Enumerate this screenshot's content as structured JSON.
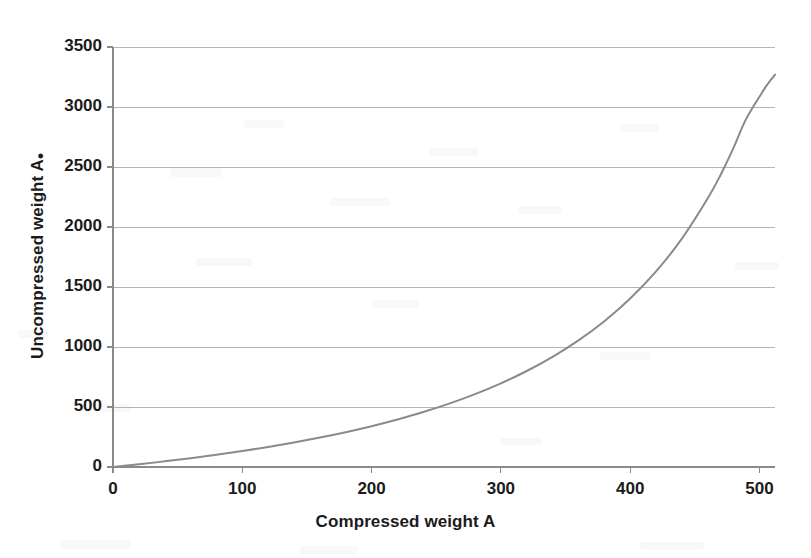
{
  "chart_data": {
    "type": "line",
    "title": "",
    "subtitle": "",
    "xlabel": "Compressed weight A",
    "ylabel": "Uncompressed weight A",
    "ylabel_subscript": "•",
    "ylabel_full": "Uncompressed weight A•",
    "xlim": [
      0,
      512
    ],
    "ylim": [
      0,
      3500
    ],
    "xticks": [
      0,
      100,
      200,
      300,
      400,
      500
    ],
    "xtick_labels": [
      "0",
      "100",
      "200",
      "300",
      "400",
      "500"
    ],
    "yticks": [
      0,
      500,
      1000,
      1500,
      2000,
      2500,
      3000,
      3500
    ],
    "ytick_labels": [
      "0",
      "500",
      "1000",
      "1500",
      "2000",
      "2500",
      "3000",
      "3500"
    ],
    "grid": "horizontal",
    "grid_color": "#b4b4b4",
    "legend": null,
    "legend_position": "none",
    "series": [
      {
        "name": "Uncompressed vs compressed weight",
        "color": "#8a8a8a",
        "line_width": 2,
        "marker": "none",
        "x": [
          0,
          20,
          40,
          60,
          80,
          100,
          120,
          140,
          160,
          180,
          200,
          220,
          240,
          260,
          280,
          300,
          320,
          340,
          360,
          380,
          400,
          420,
          440,
          460,
          470,
          480,
          488,
          495,
          500,
          504,
          507,
          509,
          510.5,
          511.4,
          512
        ],
        "y": [
          0,
          22,
          47,
          73,
          102,
          133,
          167,
          204,
          245,
          290,
          340,
          396,
          458,
          528,
          607,
          697,
          800,
          918,
          1055,
          1215,
          1404,
          1630,
          1903,
          2239,
          2436,
          2661,
          2864,
          3000,
          3085,
          3155,
          3200,
          3230,
          3248,
          3262,
          3270
        ]
      }
    ],
    "annotations": []
  },
  "axes": {
    "plot_left_px": 113,
    "plot_right_px": 775,
    "plot_top_px": 47,
    "plot_bottom_px": 467,
    "axis_color": "#8a8a8a",
    "tick_color": "#8a8a8a",
    "background": "#ffffff"
  }
}
